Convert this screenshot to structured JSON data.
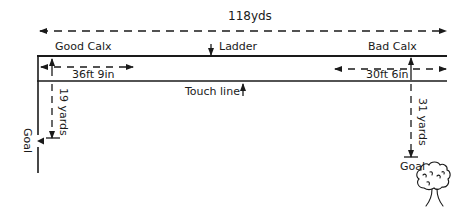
{
  "diagram": {
    "total_length": "118yds",
    "labels": {
      "good_calx": "Good Calx",
      "bad_calx": "Bad Calx",
      "ladder": "Ladder",
      "touch_line": "Touch line",
      "good_calx_width": "36ft 9in",
      "bad_calx_width": "30ft 6in",
      "left_goal_distance": "19 yards",
      "right_goal_distance": "31 yards",
      "left_goal": "Goal",
      "right_goal": "Goal"
    },
    "icons": {
      "tree": "tree-icon"
    },
    "colors": {
      "line": "#1a1a1a"
    }
  }
}
